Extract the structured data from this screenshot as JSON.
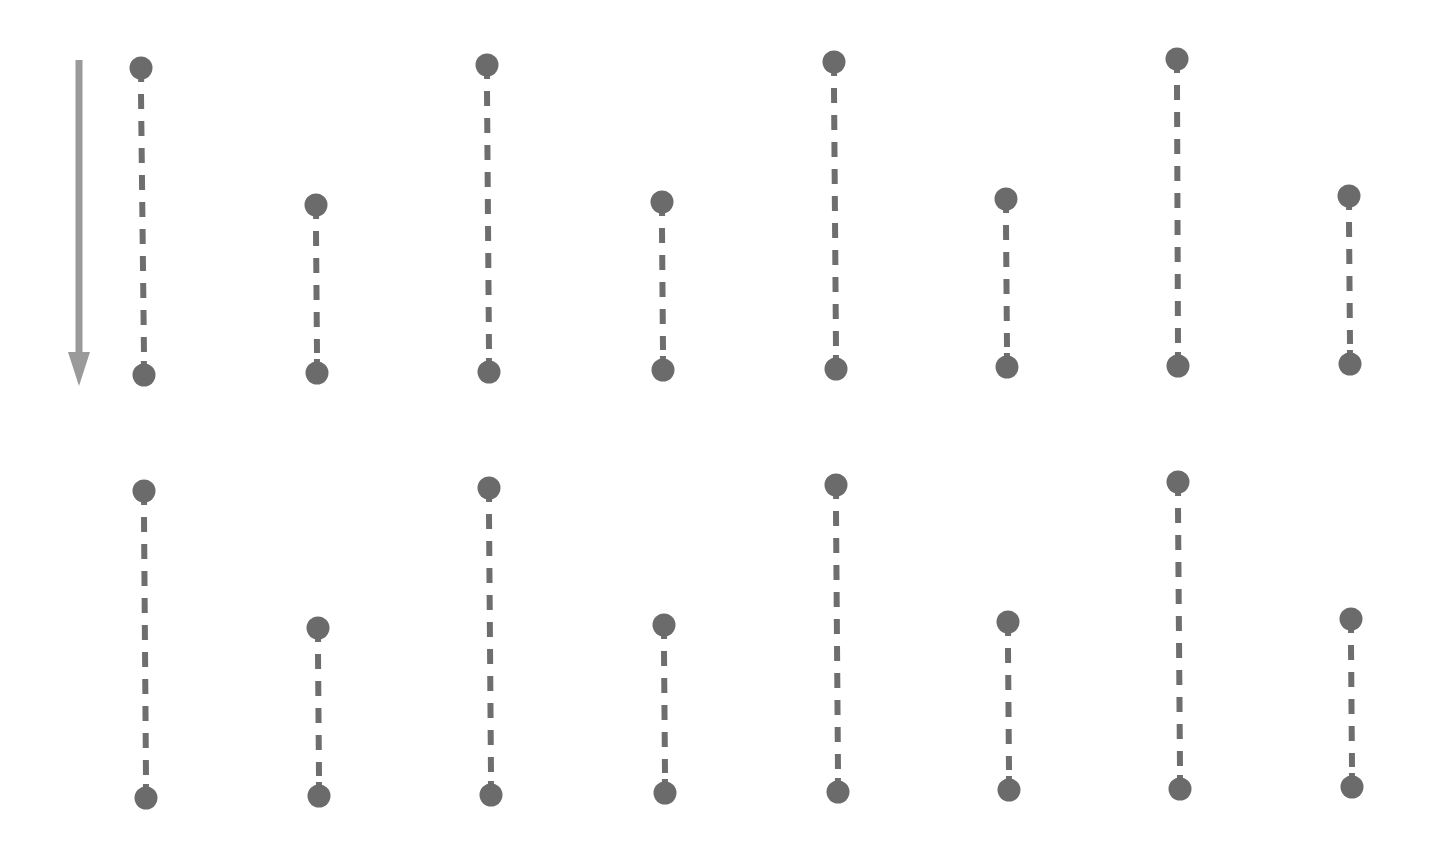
{
  "diagram": {
    "width": 1437,
    "height": 847,
    "background": "#ffffff",
    "colors": {
      "dot": "#6b6b6b",
      "segment": "#6e6e6e",
      "arrow": "#9a9a9a"
    },
    "dot_radius": 11.5,
    "segment_width": 6,
    "dash_pattern": "15 12",
    "arrow": {
      "x": 79,
      "y_start": 60,
      "y_end": 386,
      "shaft_width": 7,
      "head_width": 22,
      "head_length": 34,
      "direction": "down"
    },
    "rows": [
      {
        "segments": [
          {
            "x1": 141,
            "y1": 68,
            "x2": 144,
            "y2": 375
          },
          {
            "x1": 316,
            "y1": 205,
            "x2": 317,
            "y2": 373
          },
          {
            "x1": 487,
            "y1": 65,
            "x2": 489,
            "y2": 372
          },
          {
            "x1": 662,
            "y1": 202,
            "x2": 663,
            "y2": 370
          },
          {
            "x1": 834,
            "y1": 62,
            "x2": 836,
            "y2": 369
          },
          {
            "x1": 1006,
            "y1": 199,
            "x2": 1007,
            "y2": 367
          },
          {
            "x1": 1177,
            "y1": 59,
            "x2": 1178,
            "y2": 366
          },
          {
            "x1": 1349,
            "y1": 196,
            "x2": 1350,
            "y2": 364
          }
        ]
      },
      {
        "segments": [
          {
            "x1": 144,
            "y1": 491,
            "x2": 146,
            "y2": 798
          },
          {
            "x1": 318,
            "y1": 628,
            "x2": 319,
            "y2": 796
          },
          {
            "x1": 489,
            "y1": 488,
            "x2": 491,
            "y2": 795
          },
          {
            "x1": 664,
            "y1": 625,
            "x2": 665,
            "y2": 793
          },
          {
            "x1": 836,
            "y1": 485,
            "x2": 838,
            "y2": 792
          },
          {
            "x1": 1008,
            "y1": 622,
            "x2": 1009,
            "y2": 790
          },
          {
            "x1": 1178,
            "y1": 482,
            "x2": 1180,
            "y2": 789
          },
          {
            "x1": 1351,
            "y1": 619,
            "x2": 1352,
            "y2": 787
          }
        ]
      }
    ]
  }
}
